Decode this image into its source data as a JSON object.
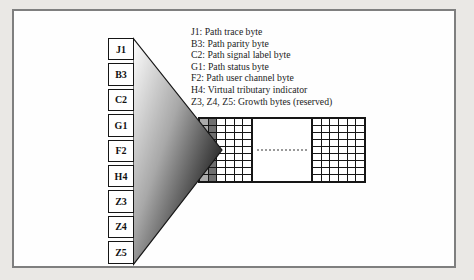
{
  "figure": {
    "background_color": "#eae8e5",
    "frame_border_color": "#7f7f7f",
    "frame_background": "#fefefe"
  },
  "legend": {
    "lines": [
      "J1:  Path trace byte",
      "B3:  Path parity byte",
      "C2:  Path signal label byte",
      "G1:  Path status byte",
      "F2:  Path user channel byte",
      "H4:  Virtual tributary indicator",
      "Z3, Z4, Z5:  Growth bytes (reserved)"
    ]
  },
  "column": {
    "bytes": [
      "J1",
      "B3",
      "C2",
      "G1",
      "F2",
      "H4",
      "Z3",
      "Z4",
      "Z5"
    ]
  },
  "wedge": {
    "gradient_from": "#ffffff",
    "gradient_mid": "#a8a8a8",
    "gradient_to": "#000000",
    "outline_color": "#161616"
  },
  "grid": {
    "rows": 9,
    "line_color": "#161616",
    "left_section": {
      "col_colors": [
        "#ababab",
        "#6f6f6f",
        "#ffffff",
        "#ffffff",
        "#ffffff",
        "#ffffff"
      ]
    },
    "right_section": {
      "col_colors": [
        "#ffffff",
        "#ffffff",
        "#ffffff",
        "#ffffff",
        "#ffffff",
        "#ffffff"
      ]
    },
    "gap": {
      "dotted_line_color": "#9a9a9a"
    }
  }
}
